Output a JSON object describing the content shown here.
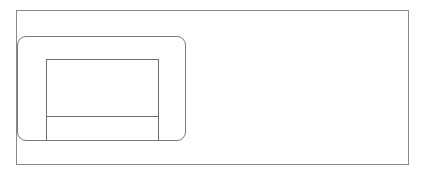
{
  "diagram": {
    "type": "wireframe-outline",
    "elements": [
      {
        "name": "outer-frame",
        "shape": "rectangle"
      },
      {
        "name": "rounded-panel",
        "shape": "rounded-rectangle"
      },
      {
        "name": "inner-box",
        "shape": "rectangle",
        "sections": 2
      }
    ],
    "colors": {
      "stroke": "#7a7a7a",
      "background": "#ffffff"
    }
  }
}
